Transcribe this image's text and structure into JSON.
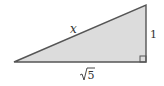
{
  "diagram": {
    "type": "right-triangle",
    "fill_color": "#dcdcdc",
    "stroke_color": "#555555",
    "vertices": {
      "left": [
        14,
        62
      ],
      "top_right": [
        146,
        5
      ],
      "bottom_right": [
        146,
        62
      ]
    },
    "labels": {
      "hypotenuse": "x",
      "vertical_leg": "1",
      "horizontal_leg_radicand": "5",
      "horizontal_leg": "√5"
    },
    "right_angle_marker": true
  }
}
